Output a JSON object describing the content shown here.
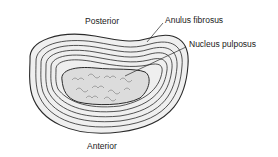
{
  "diagram": {
    "labels": {
      "posterior": "Posterior",
      "anterior": "Anterior",
      "anulus": "Anulus fibrosus",
      "nucleus": "Nucleus pulposus"
    },
    "colors": {
      "line": "#2a2a2a",
      "disc_fill": "#efefef",
      "nucleus_fill": "#dcdcdc"
    }
  }
}
